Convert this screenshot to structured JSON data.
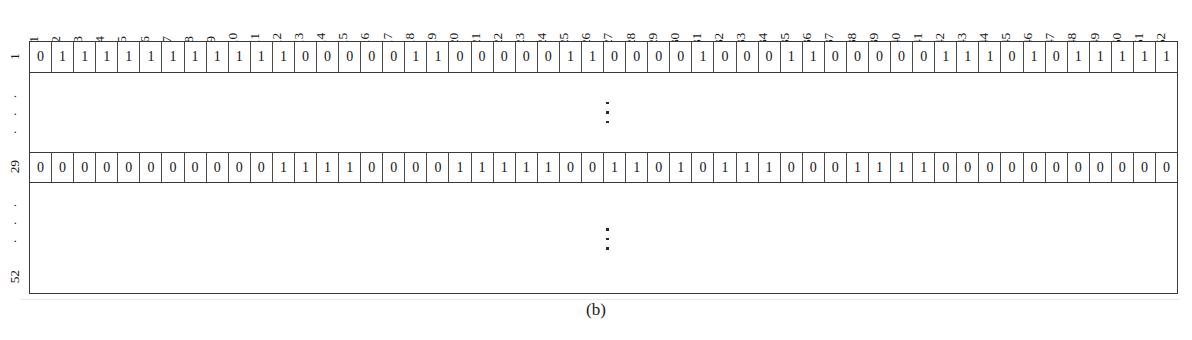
{
  "figure": {
    "caption": "(b)",
    "kind": "binary-matrix-table"
  },
  "table": {
    "column_headers": [
      "1",
      "2",
      "3",
      "4",
      "5",
      "6",
      "7",
      "8",
      "9",
      "10",
      "11",
      "12",
      "13",
      "14",
      "15",
      "16",
      "17",
      "18",
      "19",
      "20",
      "21",
      "22",
      "23",
      "24",
      "25",
      "26",
      "27",
      "28",
      "29",
      "30",
      "31",
      "32",
      "33",
      "34",
      "35",
      "36",
      "37",
      "38",
      "39",
      "40",
      "41",
      "42",
      "43",
      "44",
      "45",
      "46",
      "47",
      "48",
      "49",
      "50",
      "51",
      "52"
    ],
    "row_labels": [
      "1",
      "⋮",
      "29",
      "⋮",
      "52"
    ],
    "row_label_dots": "· · ·",
    "rows": [
      {
        "label": "1",
        "type": "data",
        "values": [
          0,
          1,
          1,
          1,
          1,
          1,
          1,
          1,
          1,
          1,
          1,
          1,
          0,
          0,
          0,
          0,
          0,
          1,
          1,
          0,
          0,
          0,
          0,
          0,
          1,
          1,
          0,
          0,
          0,
          0,
          1,
          0,
          0,
          0,
          1,
          1,
          0,
          0,
          0,
          0,
          0,
          1,
          1,
          1,
          0,
          1,
          0,
          1,
          1,
          1,
          1,
          1
        ]
      },
      {
        "label": "⋮",
        "type": "ellipsis",
        "values": []
      },
      {
        "label": "29",
        "type": "data",
        "values": [
          0,
          0,
          0,
          0,
          0,
          0,
          0,
          0,
          0,
          0,
          0,
          1,
          1,
          1,
          1,
          0,
          0,
          0,
          0,
          1,
          1,
          1,
          1,
          1,
          0,
          0,
          1,
          1,
          0,
          1,
          0,
          1,
          1,
          1,
          0,
          0,
          0,
          1,
          1,
          1,
          1,
          0,
          0,
          0,
          0,
          0,
          0,
          0,
          0,
          0,
          0,
          0
        ]
      },
      {
        "label": "⋮",
        "type": "ellipsis",
        "values": []
      },
      {
        "label": "52",
        "type": "spacer",
        "values": []
      }
    ]
  },
  "chart_data": {
    "type": "table",
    "title": "(b)",
    "xlabel": "",
    "ylabel": "",
    "categories": [
      "1",
      "2",
      "3",
      "4",
      "5",
      "6",
      "7",
      "8",
      "9",
      "10",
      "11",
      "12",
      "13",
      "14",
      "15",
      "16",
      "17",
      "18",
      "19",
      "20",
      "21",
      "22",
      "23",
      "24",
      "25",
      "26",
      "27",
      "28",
      "29",
      "30",
      "31",
      "32",
      "33",
      "34",
      "35",
      "36",
      "37",
      "38",
      "39",
      "40",
      "41",
      "42",
      "43",
      "44",
      "45",
      "46",
      "47",
      "48",
      "49",
      "50",
      "51",
      "52"
    ],
    "row_index_labels": [
      "1",
      "29"
    ],
    "series": [
      {
        "name": "1",
        "values": [
          0,
          1,
          1,
          1,
          1,
          1,
          1,
          1,
          1,
          1,
          1,
          1,
          0,
          0,
          0,
          0,
          0,
          1,
          1,
          0,
          0,
          0,
          0,
          0,
          1,
          1,
          0,
          0,
          0,
          0,
          1,
          0,
          0,
          0,
          1,
          1,
          0,
          0,
          0,
          0,
          0,
          1,
          1,
          1,
          0,
          1,
          0,
          1,
          1,
          1,
          1,
          1
        ]
      },
      {
        "name": "29",
        "values": [
          0,
          0,
          0,
          0,
          0,
          0,
          0,
          0,
          0,
          0,
          0,
          1,
          1,
          1,
          1,
          0,
          0,
          0,
          0,
          1,
          1,
          1,
          1,
          1,
          0,
          0,
          1,
          1,
          0,
          1,
          0,
          1,
          1,
          1,
          0,
          0,
          0,
          1,
          1,
          1,
          1,
          0,
          0,
          0,
          0,
          0,
          0,
          0,
          0,
          0,
          0,
          0
        ]
      }
    ],
    "full_matrix_shape": [
      52,
      52
    ],
    "displayed_rows": [
      1,
      29
    ],
    "omitted_row_ranges": [
      [
        2,
        28
      ],
      [
        30,
        52
      ]
    ],
    "value_domain": [
      0,
      1
    ],
    "grid": true,
    "legend": "none"
  },
  "colors": {
    "border": "#3a3a3a",
    "cell_border": "#4a4a4a",
    "text": "#161616",
    "background": "#ffffff"
  }
}
